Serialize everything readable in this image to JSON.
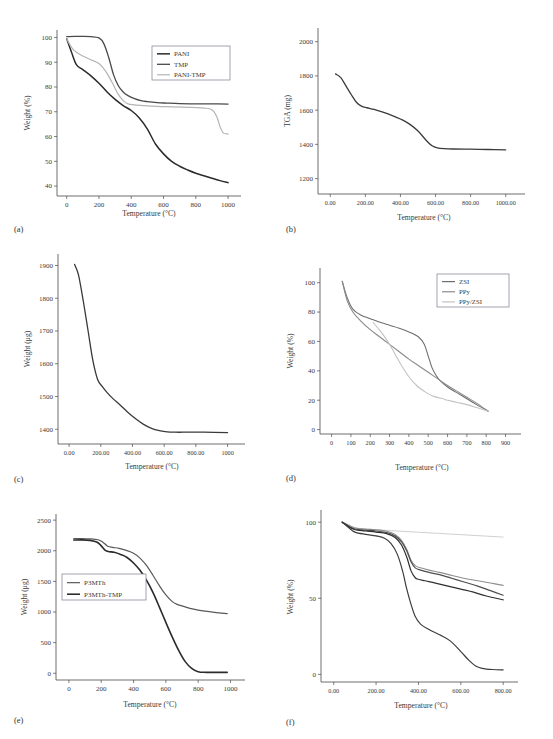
{
  "figure": {
    "panels": [
      "(a)",
      "(b)",
      "(c)",
      "(d)",
      "(e)",
      "(f)"
    ],
    "common_xlabel": "Temperature (°C)"
  },
  "chart_data": [
    {
      "id": "a",
      "panel_label": "(a)",
      "type": "line",
      "title": "",
      "xlabel": "Temperature (°C)",
      "ylabel": "Weight (%)",
      "xlim": [
        -60,
        1080
      ],
      "ylim": [
        36,
        103
      ],
      "xticks": [
        "0",
        "200",
        "400",
        "600",
        "800",
        "1000"
      ],
      "xtick_values": [
        0,
        200,
        400,
        600,
        800,
        1000
      ],
      "yticks": [
        "40",
        "50",
        "60",
        "70",
        "80",
        "90",
        "100"
      ],
      "ytick_values": [
        40,
        50,
        60,
        70,
        80,
        90,
        100
      ],
      "grid": false,
      "legend_position": "upper-right",
      "series": [
        {
          "name": "PANI",
          "color": "#2b2b2b",
          "width": 1.5,
          "x": [
            0,
            30,
            60,
            100,
            150,
            200,
            250,
            300,
            350,
            400,
            450,
            500,
            550,
            600,
            650,
            700,
            750,
            800,
            850,
            900,
            950,
            1000
          ],
          "values": [
            99.5,
            94,
            89,
            87,
            84.5,
            81.5,
            78,
            75,
            72.5,
            70.5,
            67.5,
            63,
            57,
            53,
            50,
            48,
            46.5,
            45.2,
            44.2,
            43.2,
            42.2,
            41.4
          ]
        },
        {
          "name": "TMP",
          "color": "#4a4a4a",
          "width": 1.3,
          "x": [
            0,
            50,
            100,
            150,
            200,
            230,
            260,
            290,
            320,
            350,
            380,
            420,
            460,
            500,
            560,
            620,
            700,
            800,
            900,
            1000
          ],
          "values": [
            100.3,
            100.4,
            100.4,
            100.3,
            99.8,
            97.5,
            92,
            85,
            80.5,
            78,
            76.5,
            75.3,
            74.5,
            74.1,
            73.7,
            73.5,
            73.3,
            73.2,
            73.2,
            73.1
          ]
        },
        {
          "name": "PANI-TMP",
          "color": "#b4b4b4",
          "width": 1.2,
          "x": [
            0,
            30,
            60,
            100,
            150,
            200,
            240,
            280,
            320,
            350,
            380,
            420,
            480,
            560,
            650,
            750,
            850,
            900,
            930,
            950,
            970,
            1000
          ],
          "values": [
            99.5,
            96,
            94,
            92.5,
            91,
            89.5,
            86.5,
            82,
            77,
            74.5,
            73.2,
            72.8,
            72.5,
            72.2,
            72,
            71.8,
            71.5,
            70.8,
            68,
            64,
            61.5,
            61
          ]
        }
      ]
    },
    {
      "id": "b",
      "panel_label": "(b)",
      "type": "line",
      "title": "",
      "xlabel": "Temperature (°C)",
      "ylabel": "TGA (mg)",
      "xlim": [
        -70,
        1110
      ],
      "ylim": [
        1110,
        2080
      ],
      "xticks": [
        "0.00",
        "200.00",
        "400.00",
        "600.00",
        "800.00",
        "1000.00"
      ],
      "xtick_values": [
        0,
        200,
        400,
        600,
        800,
        1000
      ],
      "yticks": [
        "1200",
        "1400",
        "1600",
        "1800",
        "2000"
      ],
      "ytick_values": [
        1200,
        1400,
        1600,
        1800,
        2000
      ],
      "grid": false,
      "series": [
        {
          "name": "TGA curve",
          "color": "#3a3a3a",
          "width": 1.3,
          "x": [
            30,
            60,
            90,
            120,
            150,
            180,
            210,
            250,
            300,
            350,
            400,
            450,
            500,
            550,
            580,
            610,
            650,
            700,
            800,
            900,
            1000
          ],
          "values": [
            1812,
            1790,
            1740,
            1690,
            1645,
            1622,
            1614,
            1604,
            1588,
            1570,
            1548,
            1520,
            1478,
            1420,
            1392,
            1380,
            1375,
            1373,
            1372,
            1370,
            1368
          ]
        }
      ]
    },
    {
      "id": "c",
      "panel_label": "(c)",
      "type": "line",
      "title": "",
      "xlabel": "Temperature (°C)",
      "ylabel": "Weight (μg)",
      "xlim": [
        -70,
        1110
      ],
      "ylim": [
        1355,
        1935
      ],
      "xticks": [
        "0.00",
        "200.00",
        "400.00",
        "600.00",
        "800.00",
        "1000"
      ],
      "xtick_values": [
        0,
        200,
        400,
        600,
        800,
        1000
      ],
      "yticks": [
        "1400",
        "1500",
        "1600",
        "1700",
        "1800",
        "1900"
      ],
      "ytick_values": [
        1400,
        1500,
        1600,
        1700,
        1800,
        1900
      ],
      "grid": false,
      "series": [
        {
          "name": "Weight curve",
          "color": "#3a3a3a",
          "width": 1.3,
          "x": [
            35,
            60,
            90,
            120,
            150,
            180,
            210,
            240,
            280,
            320,
            370,
            420,
            470,
            520,
            570,
            620,
            670,
            750,
            850,
            1000
          ],
          "values": [
            1903,
            1870,
            1790,
            1700,
            1610,
            1552,
            1530,
            1512,
            1492,
            1475,
            1452,
            1432,
            1415,
            1403,
            1396,
            1392,
            1391,
            1391,
            1391,
            1390
          ]
        }
      ]
    },
    {
      "id": "d",
      "panel_label": "(d)",
      "type": "line",
      "title": "",
      "xlabel": "Temperature (°C)",
      "ylabel": "Weight (%)",
      "xlim": [
        -60,
        980
      ],
      "ylim": [
        -3,
        110
      ],
      "xticks": [
        "0",
        "100",
        "200",
        "300",
        "400",
        "500",
        "600",
        "700",
        "800",
        "900"
      ],
      "xtick_values": [
        0,
        100,
        200,
        300,
        400,
        500,
        600,
        700,
        800,
        900
      ],
      "yticks": [
        "0",
        "20",
        "40",
        "60",
        "80",
        "100"
      ],
      "ytick_values": [
        0,
        20,
        40,
        60,
        80,
        100
      ],
      "grid": false,
      "legend_position": "upper-right",
      "series": [
        {
          "name": "ZSI",
          "color": "#6e6e6e",
          "width": 1.1,
          "x": [
            55,
            80,
            110,
            150,
            200,
            250,
            300,
            350,
            400,
            450,
            480,
            500,
            520,
            540,
            560,
            600,
            650,
            700,
            750,
            810
          ],
          "values": [
            101,
            90,
            82,
            78,
            75.5,
            73,
            71,
            69,
            66.5,
            63,
            58,
            50,
            42,
            37,
            33.5,
            29,
            25,
            21,
            17,
            12.5
          ]
        },
        {
          "name": "PPy",
          "color": "#8a8a8a",
          "width": 1.1,
          "x": [
            55,
            80,
            110,
            150,
            200,
            250,
            300,
            350,
            400,
            450,
            500,
            550,
            600,
            650,
            700,
            750,
            810
          ],
          "values": [
            101,
            88,
            80,
            74,
            68,
            63,
            58,
            53,
            48,
            43.5,
            39,
            34.5,
            30,
            26,
            22,
            18,
            12.5
          ]
        },
        {
          "name": "PPy/ZSI",
          "color": "#c3c3c3",
          "width": 1.1,
          "x": [
            215,
            240,
            270,
            300,
            330,
            360,
            400,
            440,
            480,
            520,
            560,
            578,
            585,
            600,
            650,
            700,
            750,
            810
          ],
          "values": [
            73,
            69,
            64,
            58,
            51,
            44,
            36,
            30,
            26,
            23,
            21.5,
            21,
            20.5,
            20,
            18.5,
            17,
            15,
            12.5
          ]
        }
      ]
    },
    {
      "id": "e",
      "panel_label": "(e)",
      "type": "line",
      "title": "",
      "xlabel": "Temperature (°C)",
      "ylabel": "Weight (μg)",
      "xlim": [
        -80,
        1090
      ],
      "ylim": [
        -110,
        2600
      ],
      "xticks": [
        "0",
        "200",
        "400",
        "600",
        "800",
        "1000"
      ],
      "xtick_values": [
        0,
        200,
        400,
        600,
        800,
        1000
      ],
      "yticks": [
        "0",
        "500",
        "1000",
        "1500",
        "2000",
        "2500"
      ],
      "ytick_values": [
        0,
        500,
        1000,
        1500,
        2000,
        2500
      ],
      "grid": false,
      "legend_position": "center-left",
      "series": [
        {
          "name": "P3MTh",
          "color": "#595959",
          "width": 1.2,
          "x": [
            30,
            80,
            130,
            180,
            210,
            240,
            270,
            310,
            350,
            400,
            440,
            480,
            520,
            560,
            600,
            640,
            670,
            700,
            750,
            800,
            900,
            980
          ],
          "values": [
            2200,
            2200,
            2195,
            2180,
            2140,
            2075,
            2055,
            2040,
            2010,
            1960,
            1880,
            1760,
            1600,
            1430,
            1280,
            1170,
            1125,
            1100,
            1060,
            1030,
            995,
            975
          ]
        },
        {
          "name": "P3MTh-TMP",
          "color": "#2b2b2b",
          "width": 1.6,
          "x": [
            30,
            80,
            130,
            175,
            200,
            225,
            250,
            280,
            320,
            360,
            400,
            440,
            480,
            520,
            560,
            600,
            640,
            680,
            720,
            760,
            800,
            850,
            980
          ],
          "values": [
            2175,
            2178,
            2170,
            2140,
            2080,
            2005,
            1985,
            1975,
            1940,
            1890,
            1800,
            1680,
            1520,
            1320,
            1080,
            830,
            590,
            370,
            190,
            80,
            25,
            15,
            15
          ]
        }
      ]
    },
    {
      "id": "f",
      "panel_label": "(f)",
      "type": "line",
      "title": "",
      "xlabel": "Temperature (°C)",
      "ylabel": "Weight (%)",
      "xlim": [
        -60,
        870
      ],
      "ylim": [
        -5,
        108
      ],
      "xticks": [
        "0.00",
        "200.00",
        "400.00",
        "600.00",
        "800.00"
      ],
      "xtick_values": [
        0,
        200,
        400,
        600,
        800
      ],
      "yticks": [
        "0",
        "50",
        "100"
      ],
      "ytick_values": [
        0,
        50,
        100
      ],
      "grid": false,
      "series": [
        {
          "name": "curve-1",
          "color": "#d0d0d0",
          "width": 1.0,
          "x": [
            40,
            70,
            100,
            150,
            200,
            300,
            400,
            500,
            600,
            700,
            800
          ],
          "values": [
            100,
            98.5,
            96.5,
            95.5,
            95,
            94.2,
            93.4,
            92.6,
            91.8,
            91,
            90.2
          ]
        },
        {
          "name": "curve-2",
          "color": "#8f8f8f",
          "width": 1.1,
          "x": [
            40,
            70,
            100,
            150,
            200,
            250,
            290,
            320,
            345,
            365,
            385,
            410,
            450,
            500,
            560,
            620,
            680,
            740,
            800
          ],
          "values": [
            100,
            98,
            96.2,
            95.5,
            95,
            94,
            92,
            88,
            82,
            75,
            71.5,
            70,
            68.5,
            67,
            65,
            63,
            61.5,
            60,
            58.5
          ]
        },
        {
          "name": "curve-3",
          "color": "#4f4f4f",
          "width": 1.2,
          "x": [
            40,
            70,
            100,
            150,
            200,
            250,
            290,
            320,
            345,
            365,
            385,
            410,
            450,
            500,
            560,
            620,
            680,
            740,
            800
          ],
          "values": [
            100,
            97.5,
            95.5,
            94.8,
            94.2,
            93.2,
            91,
            87,
            81,
            74,
            70,
            68.5,
            67,
            65.5,
            63,
            60.5,
            58,
            55,
            52
          ]
        },
        {
          "name": "curve-4",
          "color": "#2f2f2f",
          "width": 1.2,
          "x": [
            40,
            70,
            100,
            150,
            200,
            250,
            290,
            320,
            345,
            365,
            385,
            400,
            430,
            480,
            540,
            600,
            660,
            720,
            800
          ],
          "values": [
            100,
            97,
            95,
            94.2,
            93.5,
            92.5,
            90,
            85,
            77,
            68,
            63.5,
            62.5,
            61.5,
            60,
            58,
            56,
            54,
            51.5,
            49
          ]
        },
        {
          "name": "curve-5",
          "color": "#3d3d3d",
          "width": 1.2,
          "x": [
            40,
            70,
            100,
            150,
            200,
            240,
            270,
            300,
            325,
            345,
            365,
            385,
            410,
            450,
            500,
            550,
            600,
            640,
            670,
            700,
            750,
            800
          ],
          "values": [
            100,
            96.5,
            93.5,
            92,
            91,
            89.5,
            86,
            79,
            68,
            56,
            46,
            38,
            33,
            29.5,
            26,
            22,
            15,
            9,
            5.5,
            4,
            3.2,
            3
          ]
        }
      ]
    }
  ]
}
